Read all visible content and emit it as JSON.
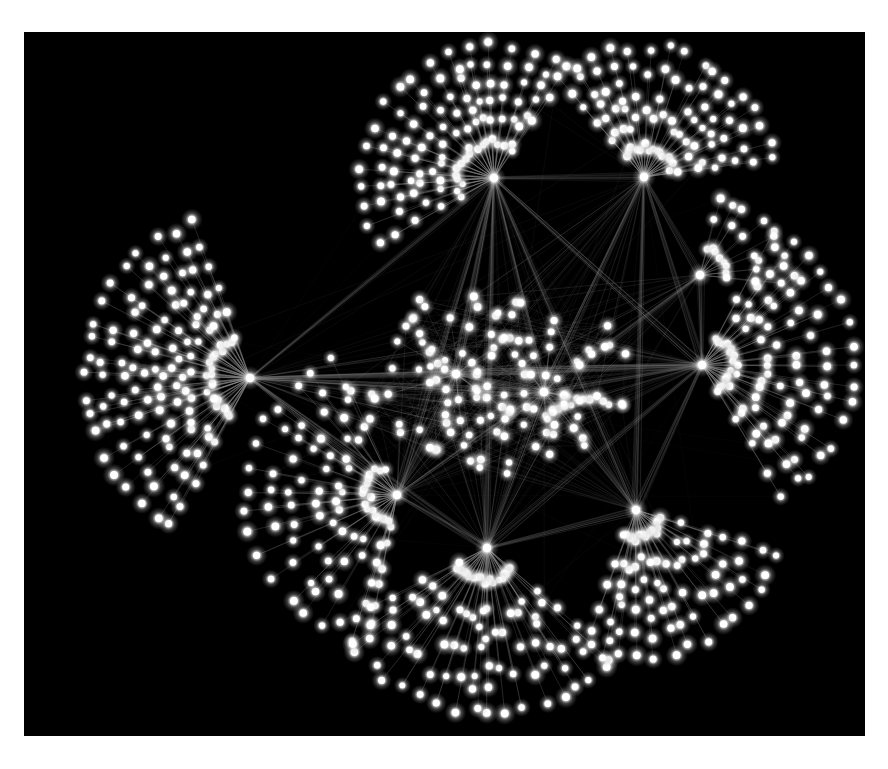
{
  "view": {
    "title": "Network Graph Visualization",
    "background_color": "#ffffff",
    "canvas_color": "#000000",
    "canvas_rect": [
      24,
      32,
      841,
      704
    ]
  },
  "style": {
    "node_color": "#ffffff",
    "node_glow_color": "#b8b8b8",
    "edge_color": "#8c8c8c",
    "hub_color": "#ffffff",
    "node_radius": 3.4,
    "hub_radius": 4.2,
    "edge_width": 0.42,
    "edge_opacity": 0.5
  },
  "chart_data": {
    "type": "scatter",
    "xlabel": "",
    "ylabel": "",
    "layout": "force-directed hub-and-spoke network",
    "grid": false,
    "legend": null,
    "xlim": [
      0,
      841
    ],
    "ylim": [
      0,
      704
    ],
    "node_count_approx": 640,
    "hub_count": 10,
    "hubs": [
      {
        "id": "h-left",
        "name": "left-hub",
        "x": 226,
        "y": 346,
        "degree": 132,
        "fan_angle_deg": [
          118,
          250
        ],
        "fan_r": [
          42,
          165
        ],
        "rings": 7,
        "spokes": 20
      },
      {
        "id": "h-top",
        "name": "top-hub",
        "x": 470,
        "y": 146,
        "degree": 104,
        "fan_angle_deg": [
          150,
          305
        ],
        "fan_r": [
          36,
          132
        ],
        "rings": 6,
        "spokes": 18
      },
      {
        "id": "h-topright",
        "name": "top-right-hub",
        "x": 620,
        "y": 145,
        "degree": 88,
        "fan_angle_deg": [
          232,
          352
        ],
        "fan_r": [
          30,
          130
        ],
        "rings": 6,
        "spokes": 16
      },
      {
        "id": "h-right",
        "name": "right-hub",
        "x": 678,
        "y": 333,
        "degree": 96,
        "fan_angle_deg": [
          -60,
          60
        ],
        "fan_r": [
          32,
          152
        ],
        "rings": 6,
        "spokes": 17
      },
      {
        "id": "h-rightsmall",
        "name": "right-small-hub",
        "x": 676,
        "y": 243,
        "degree": 22,
        "fan_angle_deg": [
          -78,
          8
        ],
        "fan_r": [
          28,
          80
        ],
        "rings": 3,
        "spokes": 8
      },
      {
        "id": "h-botleft",
        "name": "bottom-left-hub",
        "x": 373,
        "y": 463,
        "degree": 92,
        "fan_angle_deg": [
          100,
          245
        ],
        "fan_r": [
          30,
          150
        ],
        "rings": 6,
        "spokes": 17
      },
      {
        "id": "h-botcenter",
        "name": "bottom-center-hub",
        "x": 463,
        "y": 516,
        "degree": 110,
        "fan_angle_deg": [
          40,
          152
        ],
        "fan_r": [
          34,
          165
        ],
        "rings": 6,
        "spokes": 19
      },
      {
        "id": "h-botright",
        "name": "bottom-right-hub",
        "x": 612,
        "y": 478,
        "degree": 80,
        "fan_angle_deg": [
          18,
          118
        ],
        "fan_r": [
          28,
          148
        ],
        "rings": 6,
        "spokes": 15
      },
      {
        "id": "h-core-a",
        "name": "core-hub-a",
        "x": 432,
        "y": 342,
        "degree": 34,
        "fan_angle_deg": [
          0,
          360
        ],
        "fan_r": [
          22,
          68
        ],
        "rings": 3,
        "spokes": 10
      },
      {
        "id": "h-core-b",
        "name": "core-hub-b",
        "x": 520,
        "y": 360,
        "degree": 30,
        "fan_angle_deg": [
          0,
          360
        ],
        "fan_r": [
          20,
          64
        ],
        "rings": 3,
        "spokes": 9
      }
    ],
    "inter_hub_edges": [
      [
        "h-left",
        "h-top"
      ],
      [
        "h-left",
        "h-right"
      ],
      [
        "h-left",
        "h-core-a"
      ],
      [
        "h-left",
        "h-core-b"
      ],
      [
        "h-left",
        "h-botleft"
      ],
      [
        "h-left",
        "h-botcenter"
      ],
      [
        "h-top",
        "h-topright"
      ],
      [
        "h-top",
        "h-right"
      ],
      [
        "h-top",
        "h-core-a"
      ],
      [
        "h-top",
        "h-core-b"
      ],
      [
        "h-top",
        "h-botleft"
      ],
      [
        "h-top",
        "h-botcenter"
      ],
      [
        "h-top",
        "h-botright"
      ],
      [
        "h-topright",
        "h-right"
      ],
      [
        "h-topright",
        "h-rightsmall"
      ],
      [
        "h-topright",
        "h-core-b"
      ],
      [
        "h-right",
        "h-rightsmall"
      ],
      [
        "h-right",
        "h-core-a"
      ],
      [
        "h-right",
        "h-core-b"
      ],
      [
        "h-right",
        "h-botright"
      ],
      [
        "h-right",
        "h-botcenter"
      ],
      [
        "h-botleft",
        "h-botcenter"
      ],
      [
        "h-botleft",
        "h-core-a"
      ],
      [
        "h-botleft",
        "h-core-b"
      ],
      [
        "h-botcenter",
        "h-botright"
      ],
      [
        "h-botcenter",
        "h-core-b"
      ],
      [
        "h-botright",
        "h-core-b"
      ],
      [
        "h-core-a",
        "h-core-b"
      ],
      [
        "h-rightsmall",
        "h-core-b"
      ],
      [
        "h-topright",
        "h-botright"
      ]
    ],
    "core_cloud": {
      "name": "central-node-cloud",
      "center": [
        470,
        350
      ],
      "radius_x": 150,
      "radius_y": 95,
      "count": 78
    }
  }
}
